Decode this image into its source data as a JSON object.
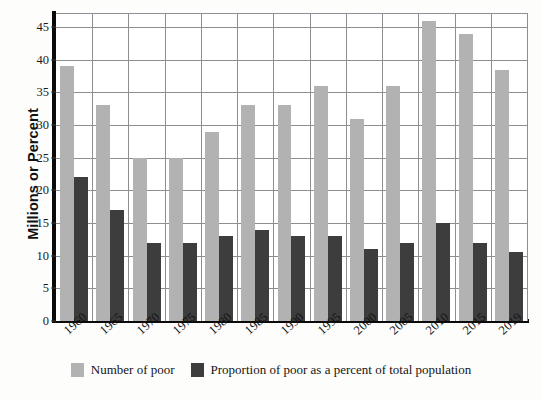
{
  "chart_data": {
    "type": "bar",
    "title": "",
    "xlabel": "",
    "ylabel": "Millions or Percent",
    "ylim": [
      0,
      47
    ],
    "yticks": [
      0,
      5,
      10,
      15,
      20,
      25,
      30,
      35,
      40,
      45
    ],
    "grid": true,
    "legend_position": "bottom",
    "categories": [
      "1960",
      "1965",
      "1970",
      "1975",
      "1980",
      "1985",
      "1990",
      "1995",
      "2000",
      "2005",
      "2010",
      "2015",
      "2019"
    ],
    "series": [
      {
        "name": "Number of poor",
        "color": "#b2b2b2",
        "values": [
          39,
          33,
          25,
          25,
          29,
          33,
          33,
          36,
          31,
          36,
          46,
          44,
          38.5
        ]
      },
      {
        "name": "Proportion of poor as a percent of total population",
        "color": "#3d3d3d",
        "values": [
          22,
          17,
          12,
          12,
          13,
          14,
          13,
          13,
          11,
          12,
          15,
          12,
          10.5
        ]
      }
    ]
  },
  "axis": {
    "y_title": "Millions or Percent"
  },
  "legend": {
    "items": [
      {
        "label": "Number of poor",
        "color": "#b2b2b2"
      },
      {
        "label": "Proportion of poor as a percent of total population",
        "color": "#3d3d3d"
      }
    ]
  }
}
